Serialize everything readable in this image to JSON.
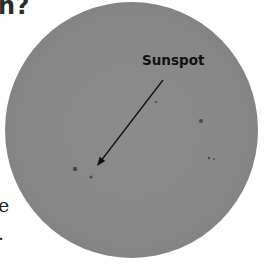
{
  "heading": {
    "text": "n?"
  },
  "figure": {
    "label": "Sunspot",
    "sun_color": "#878787",
    "spots": [
      {
        "x": 75,
        "y": 169,
        "r": 2.2
      },
      {
        "x": 91,
        "y": 177,
        "r": 1.5
      },
      {
        "x": 156,
        "y": 102,
        "r": 1.1
      },
      {
        "x": 201,
        "y": 121,
        "r": 2.0
      },
      {
        "x": 209,
        "y": 158,
        "r": 1.2
      },
      {
        "x": 214,
        "y": 159,
        "r": 0.9
      }
    ],
    "arrow": {
      "x1": 163,
      "y1": 80,
      "x2": 97,
      "y2": 166
    }
  },
  "side_text": {
    "line1": "e",
    "line2": "."
  }
}
